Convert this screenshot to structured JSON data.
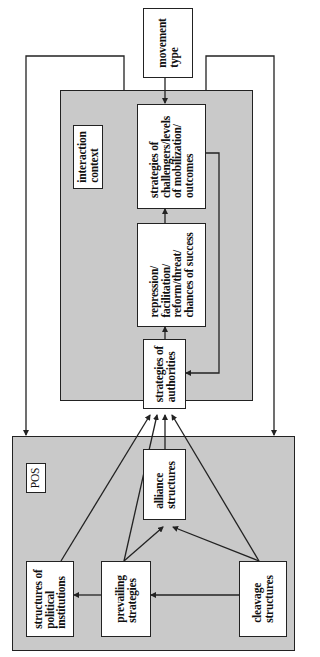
{
  "diagram": {
    "movement_type": "movement\ntype",
    "interaction_context": {
      "label": "interaction\ncontext",
      "challengers": "strategies of\nchallengers/levels\nof mobilization/\noutcomes",
      "interaction_outcomes": "repression/\nfacilitation/\nreform/threat/\nchances of success",
      "authorities": "strategies of\nauthorities"
    },
    "pos": {
      "label": "POS",
      "alliance": "alliance\nstructures",
      "political_institutions": "structures of\npolitical\ninstitutions",
      "prevailing_strategies": "prevailing\nstrategies",
      "cleavage": "cleavage\nstructures"
    },
    "colors": {
      "panel_fill": "#c9c9c9",
      "box_fill": "#ffffff",
      "stroke": "#222222"
    }
  }
}
